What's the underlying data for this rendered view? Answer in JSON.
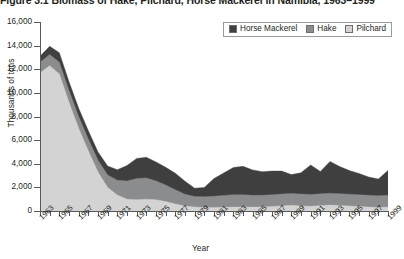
{
  "figure": {
    "title": "Figure 3.1  Biomass of Hake, Pilchard, Horse Mackerel in Namibia, 1963–1999"
  },
  "axes": {
    "ytitle": "Thousands of tons",
    "xtitle": "Year",
    "yticklabels": [
      "16,000",
      "14,000",
      "12,000",
      "10,000",
      "8,000",
      "6,000",
      "4,000",
      "2,000",
      "0"
    ],
    "xticklabels": [
      "1963",
      "1965",
      "1967",
      "1969",
      "1971",
      "1973",
      "1975",
      "1977",
      "1979",
      "1981",
      "1983",
      "1985",
      "1987",
      "1989",
      "1991",
      "1993",
      "1995",
      "1997",
      "1999"
    ]
  },
  "legend": {
    "items": [
      {
        "label": "Horse Mackerel",
        "color": "#3f3f40"
      },
      {
        "label": "Hake",
        "color": "#8b8c8e"
      },
      {
        "label": "Pilchard",
        "color": "#d3d3d3"
      }
    ]
  },
  "colors": {
    "horse_mackerel": "#3f3f40",
    "hake": "#8b8c8e",
    "pilchard": "#d3d3d3",
    "axis": "#58595b",
    "text": "#231f20"
  },
  "chart_data": {
    "type": "area",
    "stacked": true,
    "title": "Figure 3.1  Biomass of Hake, Pilchard, Horse Mackerel in Namibia, 1963–1999",
    "xlabel": "Year",
    "ylabel": "Thousands of tons",
    "xlim": [
      1963,
      1999
    ],
    "ylim": [
      0,
      16000
    ],
    "ytick_step": 2000,
    "grid": false,
    "legend_position": "top-right",
    "x": [
      1963,
      1964,
      1965,
      1966,
      1967,
      1968,
      1969,
      1970,
      1971,
      1972,
      1973,
      1974,
      1975,
      1976,
      1977,
      1978,
      1979,
      1980,
      1981,
      1982,
      1983,
      1984,
      1985,
      1986,
      1987,
      1988,
      1989,
      1990,
      1991,
      1992,
      1993,
      1994,
      1995,
      1996,
      1997,
      1998,
      1999
    ],
    "series": [
      {
        "name": "Pilchard",
        "values": [
          11700,
          12300,
          11600,
          9200,
          7000,
          5100,
          3300,
          2000,
          1350,
          1000,
          950,
          1000,
          950,
          800,
          600,
          420,
          330,
          300,
          300,
          320,
          330,
          330,
          330,
          330,
          380,
          430,
          480,
          430,
          400,
          450,
          500,
          470,
          420,
          380,
          330,
          300,
          330
        ]
      },
      {
        "name": "Hake",
        "values": [
          900,
          950,
          1000,
          1000,
          1000,
          1000,
          1000,
          1050,
          1250,
          1550,
          1800,
          1800,
          1600,
          1400,
          1200,
          1000,
          900,
          900,
          950,
          1000,
          1050,
          1050,
          1000,
          1000,
          1000,
          1000,
          1000,
          1000,
          1000,
          1000,
          1000,
          1000,
          1000,
          1000,
          1000,
          1000,
          1000
        ]
      },
      {
        "name": "Horse Mackerel",
        "values": [
          500,
          700,
          800,
          750,
          700,
          700,
          700,
          750,
          900,
          1300,
          1700,
          1750,
          1600,
          1500,
          1400,
          1100,
          700,
          800,
          1500,
          1900,
          2300,
          2400,
          2150,
          2000,
          2000,
          1950,
          1600,
          1800,
          2500,
          1900,
          2700,
          2300,
          2000,
          1800,
          1550,
          1400,
          2100
        ]
      }
    ],
    "totals": [
      13100,
      13950,
      13400,
      10950,
      8700,
      6800,
      5000,
      3800,
      3500,
      3850,
      4450,
      4550,
      4150,
      3700,
      3200,
      2520,
      1930,
      2000,
      2750,
      3220,
      3680,
      3780,
      3480,
      3330,
      3380,
      3380,
      3080,
      3230,
      3900,
      3350,
      4200,
      3770,
      3420,
      3180,
      2880,
      2700,
      3430
    ]
  }
}
